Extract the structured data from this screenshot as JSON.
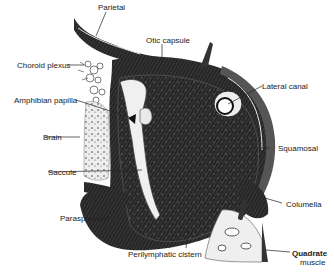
{
  "figure": {
    "type": "anatomical cross-section",
    "colors": {
      "bone_dark": "#2a2a2a",
      "bone_mid": "#555555",
      "fluid_light": "#f7f7f7",
      "background": "#ffffff",
      "label_text": "#222222"
    },
    "labels": [
      {
        "id": "parietal",
        "text": "Parietal"
      },
      {
        "id": "otic-capsule",
        "text": "Otic capsule"
      },
      {
        "id": "choroid-plexus",
        "text": "Choroid plexus"
      },
      {
        "id": "lateral-canal",
        "text": "Lateral canal"
      },
      {
        "id": "amphibian-papilla",
        "text": "Amphibian papilla"
      },
      {
        "id": "brain",
        "text": "Brain"
      },
      {
        "id": "squamosal",
        "text": "Squamosal"
      },
      {
        "id": "saccule",
        "text": "Saccule"
      },
      {
        "id": "columella",
        "text": "Columella"
      },
      {
        "id": "parasphenoid",
        "text": "Parasphenoid"
      },
      {
        "id": "perilymphatic-cistern",
        "text": "Perilymphatic cistern"
      },
      {
        "id": "quadrate",
        "text": "Quadrate"
      },
      {
        "id": "muscle",
        "text": "muscle"
      }
    ]
  }
}
